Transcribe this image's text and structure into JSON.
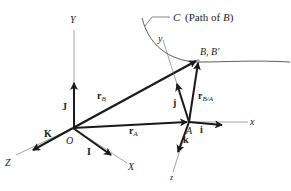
{
  "diagram": {
    "type": "vector-kinematics-frames",
    "colors": {
      "ink": "#1a1a1a",
      "axis": "#555555",
      "background": "#ffffff"
    },
    "curve": {
      "label": "C (Path of B)",
      "label_letter": "C",
      "label_rest": "(Path of ",
      "label_point": "B",
      "label_close": ")"
    },
    "fixed_frame": {
      "origin": "O",
      "axes": {
        "x": "X",
        "y": "Y",
        "z": "Z"
      },
      "unit_vectors": {
        "i": "I",
        "j": "J",
        "k": "K"
      }
    },
    "moving_frame": {
      "origin": "A",
      "axes": {
        "x": "x",
        "y": "y",
        "z": "z"
      },
      "unit_vectors": {
        "i": "i",
        "j": "j",
        "k": "k"
      }
    },
    "points": {
      "B": "B, B′"
    },
    "vectors": {
      "rB": {
        "main": "r",
        "sub": "B"
      },
      "rA": {
        "main": "r",
        "sub": "A"
      },
      "rBA": {
        "main": "r",
        "sub": "B/A"
      }
    }
  }
}
